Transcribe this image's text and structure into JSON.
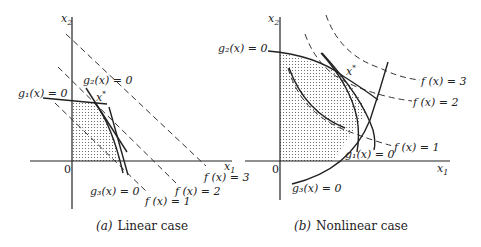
{
  "panels": [
    {
      "id": "a",
      "caption_letter": "(a)",
      "caption_text": "Linear case",
      "axis_x_label": "x",
      "axis_x_sub": "1",
      "axis_y_label": "x",
      "axis_y_sub": "2",
      "origin_label": "0",
      "optimum_label": "x",
      "optimum_sup": "*",
      "constraints": [
        {
          "name": "g1",
          "label": "g₁(x) = 0"
        },
        {
          "name": "g2",
          "label": "g₂(x) = 0"
        },
        {
          "name": "g3",
          "label": "g₃(x) = 0"
        }
      ],
      "contours": [
        {
          "name": "f1",
          "label": "f (x) = 1"
        },
        {
          "name": "f2",
          "label": "f (x) = 2"
        },
        {
          "name": "f3",
          "label": "f (x) = 3"
        }
      ]
    },
    {
      "id": "b",
      "caption_letter": "(b)",
      "caption_text": "Nonlinear case",
      "axis_x_label": "x",
      "axis_x_sub": "1",
      "axis_y_label": "x",
      "axis_y_sub": "2",
      "origin_label": "0",
      "optimum_label": "x",
      "optimum_sup": "*",
      "constraints": [
        {
          "name": "g1",
          "label": "g₁(x) = 0"
        },
        {
          "name": "g2",
          "label": "g₂(x) = 0"
        },
        {
          "name": "g3",
          "label": "g₃(x) = 0"
        }
      ],
      "contours": [
        {
          "name": "f1",
          "label": "f (x) = 1"
        },
        {
          "name": "f2",
          "label": "f (x) = 2"
        },
        {
          "name": "f3",
          "label": "f (x) = 3"
        }
      ]
    }
  ]
}
